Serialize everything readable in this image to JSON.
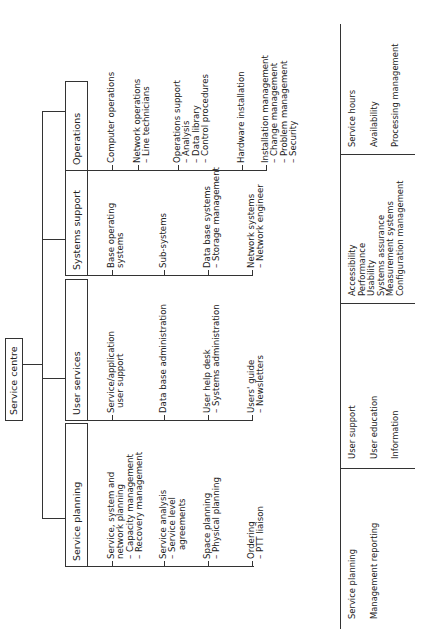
{
  "root": {
    "label": "Service centre"
  },
  "columns": [
    {
      "header": "Service planning",
      "items": [
        {
          "lines": [
            "Service, system and",
            "network planning"
          ],
          "subs": [
            "– Capacity management",
            "– Recovery management"
          ]
        },
        {
          "lines": [
            "Service analysis"
          ],
          "subs": [
            "– Service level",
            "   agreements"
          ]
        },
        {
          "lines": [
            "Space planning"
          ],
          "subs": [
            "– Physical planning"
          ]
        },
        {
          "lines": [
            "Ordering"
          ],
          "subs": [
            "– PTT liaison"
          ]
        }
      ]
    },
    {
      "header": "User services",
      "items": [
        {
          "lines": [
            "Service/application",
            "user support"
          ],
          "subs": []
        },
        {
          "lines": [
            "Data base administration"
          ],
          "subs": []
        },
        {
          "lines": [
            "User help desk"
          ],
          "subs": [
            "– Systems administration"
          ]
        },
        {
          "lines": [
            "Users' guide"
          ],
          "subs": [
            "– Newsletters"
          ]
        }
      ]
    },
    {
      "header": "Systems support",
      "items": [
        {
          "lines": [
            "Base operating",
            "systems"
          ],
          "subs": []
        },
        {
          "lines": [
            "Sub-systems"
          ],
          "subs": []
        },
        {
          "lines": [
            "Data base systems"
          ],
          "subs": [
            "– Storage management"
          ]
        },
        {
          "lines": [
            "Network systems"
          ],
          "subs": [
            "– Network engineer"
          ]
        }
      ]
    },
    {
      "header": "Operations",
      "items": [
        {
          "lines": [
            "Computer operations"
          ],
          "subs": []
        },
        {
          "lines": [
            "Network operations"
          ],
          "subs": [
            "– Line technicians"
          ]
        },
        {
          "lines": [
            "Operations support"
          ],
          "subs": [
            "– Analysis",
            "– Data library",
            "– Control procedures"
          ]
        },
        {
          "lines": [
            "Hardware installation"
          ],
          "subs": []
        },
        {
          "lines": [
            "Installation management"
          ],
          "subs": [
            "– Change management",
            "– Problem management",
            "– Security"
          ]
        }
      ]
    }
  ],
  "table": {
    "cells": [
      [
        "Service planning",
        "Management reporting"
      ],
      [
        "User support",
        "User education",
        "Information"
      ],
      [
        "Accessibility",
        "Performance",
        "Usability",
        "Systems assurance",
        "Measurement systems",
        "Configuration management"
      ],
      [
        "Service hours",
        "Availability",
        "Processing management"
      ]
    ]
  }
}
